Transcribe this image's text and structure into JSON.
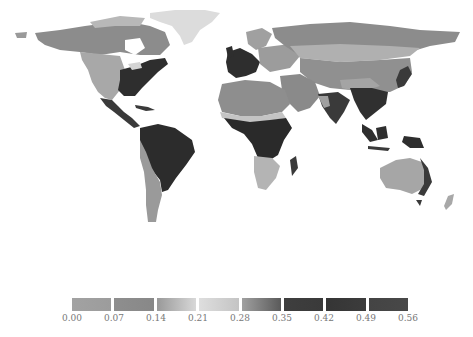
{
  "map": {
    "type": "world-choropleth",
    "colormap": "grayscale-diverging",
    "regions": [
      {
        "name": "north-america-east",
        "shade": "#2e2e2e"
      },
      {
        "name": "north-america-west",
        "shade": "#a8a8a8"
      },
      {
        "name": "canada-north",
        "shade": "#8a8a8a"
      },
      {
        "name": "greenland",
        "shade": "#dcdcdc"
      },
      {
        "name": "central-america",
        "shade": "#3a3a3a"
      },
      {
        "name": "south-america-amazon",
        "shade": "#2c2c2c"
      },
      {
        "name": "south-america-andes",
        "shade": "#9a9a9a"
      },
      {
        "name": "europe-west",
        "shade": "#2e2e2e"
      },
      {
        "name": "europe-east",
        "shade": "#9c9c9c"
      },
      {
        "name": "russia",
        "shade": "#8c8c8c"
      },
      {
        "name": "sahara",
        "shade": "#8e8e8e"
      },
      {
        "name": "sahel",
        "shade": "#c4c4c4"
      },
      {
        "name": "central-africa",
        "shade": "#2a2a2a"
      },
      {
        "name": "southern-africa",
        "shade": "#b4b4b4"
      },
      {
        "name": "middle-east",
        "shade": "#8a8a8a"
      },
      {
        "name": "central-asia",
        "shade": "#909090"
      },
      {
        "name": "south-asia",
        "shade": "#3a3a3a"
      },
      {
        "name": "southeast-asia",
        "shade": "#303030"
      },
      {
        "name": "indonesia",
        "shade": "#2e2e2e"
      },
      {
        "name": "australia-interior",
        "shade": "#a6a6a6"
      },
      {
        "name": "australia-east",
        "shade": "#3a3a3a"
      }
    ]
  },
  "legend": {
    "segments": [
      {
        "from": "#a2a2a2",
        "to": "#9c9c9c"
      },
      {
        "from": "#8e8e8e",
        "to": "#888888"
      },
      {
        "from": "#999999",
        "to": "#d8d8d8"
      },
      {
        "from": "#dedede",
        "to": "#c4c4c4"
      },
      {
        "from": "#a0a0a0",
        "to": "#5a5a5a"
      },
      {
        "from": "#3e3e3e",
        "to": "#3a3a3a"
      },
      {
        "from": "#353535",
        "to": "#3c3c3c"
      },
      {
        "from": "#444444",
        "to": "#484848"
      }
    ],
    "ticks": [
      "0.00",
      "0.07",
      "0.14",
      "0.21",
      "0.28",
      "0.35",
      "0.42",
      "0.49",
      "0.56"
    ]
  }
}
